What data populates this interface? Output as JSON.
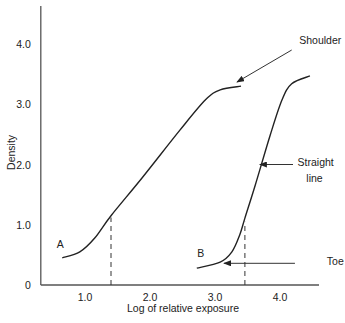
{
  "chart_data": {
    "type": "line",
    "title": "",
    "xlabel": "Log of relative exposure",
    "ylabel": "Density",
    "xlim": [
      0.32,
      4.6
    ],
    "ylim": [
      0,
      4.5
    ],
    "x_ticks": [
      1.0,
      2.0,
      3.0,
      4.0
    ],
    "x_tick_labels": [
      "1.0",
      "2.0",
      "3.0",
      "4.0"
    ],
    "y_ticks": [
      0,
      1.0,
      2.0,
      3.0,
      4.0
    ],
    "y_tick_labels": [
      "0",
      "1.0",
      "2.0",
      "3.0",
      "4.0"
    ],
    "grid": false,
    "legend": null,
    "series": [
      {
        "name": "A",
        "x": [
          0.65,
          0.92,
          1.15,
          1.4,
          1.88,
          2.46,
          2.85,
          3.08,
          3.4
        ],
        "y": [
          0.45,
          0.55,
          0.78,
          1.15,
          1.78,
          2.57,
          3.07,
          3.24,
          3.3
        ]
      },
      {
        "name": "B",
        "x": [
          2.72,
          3.08,
          3.26,
          3.38,
          3.46,
          3.62,
          3.85,
          4.03,
          4.18,
          4.46
        ],
        "y": [
          0.28,
          0.38,
          0.55,
          0.83,
          1.11,
          1.66,
          2.49,
          3.07,
          3.34,
          3.47
        ]
      }
    ],
    "reference_lines": [
      {
        "name": "A-dropline",
        "x": 1.4,
        "y_from": 0,
        "y_to": 1.12,
        "style": "dashed"
      },
      {
        "name": "B-dropline",
        "x": 3.46,
        "y_from": 0,
        "y_to": 1.05,
        "style": "dashed"
      }
    ],
    "annotations": [
      {
        "text": "A",
        "x": 0.62,
        "y": 0.62,
        "kind": "series-label"
      },
      {
        "text": "B",
        "x": 2.78,
        "y": 0.46,
        "kind": "series-label"
      },
      {
        "text": "Shoulder",
        "x": 4.45,
        "y": 4.0,
        "arrow_to": [
          3.34,
          3.37
        ],
        "arrow_from": [
          4.18,
          3.9
        ]
      },
      {
        "text": "Straight",
        "line2": "line",
        "x": 4.27,
        "y": 1.98,
        "arrow_to": [
          3.69,
          2.0
        ],
        "arrow_from": [
          4.2,
          2.0
        ]
      },
      {
        "text": "Toe",
        "x": 4.72,
        "y": 0.33,
        "arrow_to": [
          3.14,
          0.36
        ],
        "arrow_from": [
          4.23,
          0.36
        ]
      }
    ]
  }
}
